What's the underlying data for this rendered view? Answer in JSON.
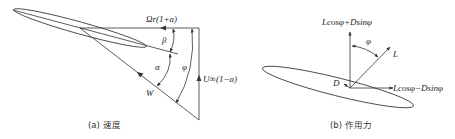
{
  "figure": {
    "panel_a": {
      "caption": "(a) 速度",
      "labels": {
        "rotational_velocity": "Ωr(1+a)",
        "axial_velocity": "U∞(1−a)",
        "relative_velocity": "W",
        "twist_angle": "β",
        "angle_of_attack": "α",
        "inflow_angle": "φ"
      }
    },
    "panel_b": {
      "caption": "(b) 作用力",
      "labels": {
        "normal_force": "Lcosφ+Dsinφ",
        "tangential_force": "Lcosφ−Dsinφ",
        "lift": "L",
        "drag": "D",
        "inflow_angle": "φ"
      }
    },
    "colors": {
      "line": "#333333",
      "text": "#222222",
      "background": "#ffffff"
    }
  }
}
